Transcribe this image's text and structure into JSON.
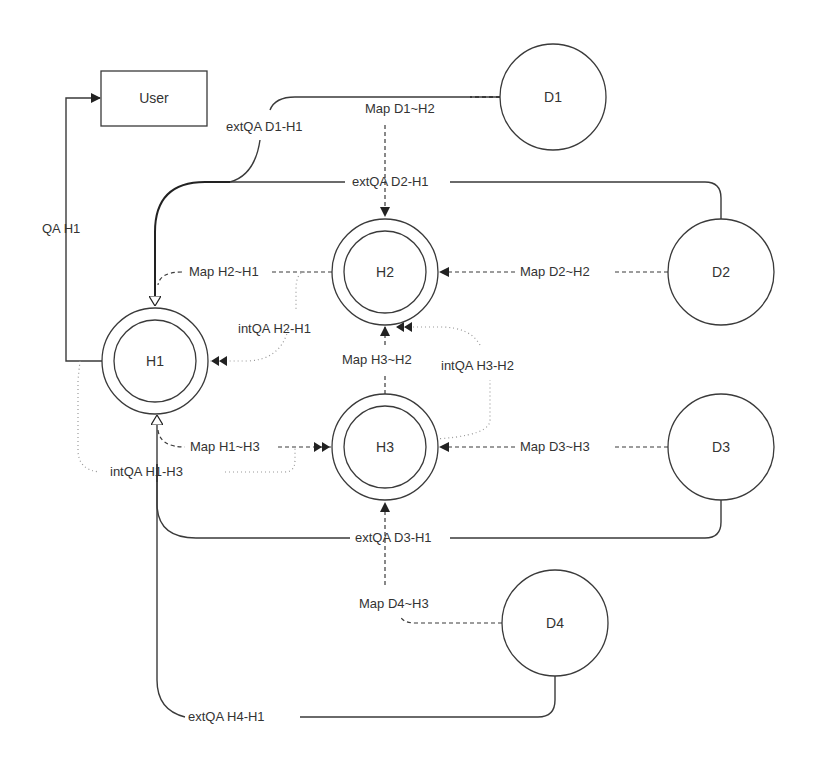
{
  "diagram": {
    "nodes": {
      "user": {
        "label": "User"
      },
      "h1": {
        "label": "H1"
      },
      "h2": {
        "label": "H2"
      },
      "h3": {
        "label": "H3"
      },
      "d1": {
        "label": "D1"
      },
      "d2": {
        "label": "D2"
      },
      "d3": {
        "label": "D3"
      },
      "d4": {
        "label": "D4"
      }
    },
    "edges": {
      "qa_h1": {
        "label": "QA H1"
      },
      "extqa_d1_h1": {
        "label": "extQA D1-H1"
      },
      "map_d1_h2": {
        "label": "Map D1~H2"
      },
      "extqa_d2_h1": {
        "label": "extQA D2-H1"
      },
      "map_h2_h1": {
        "label": "Map H2~H1"
      },
      "map_d2_h2": {
        "label": "Map D2~H2"
      },
      "intqa_h2_h1": {
        "label": "intQA H2-H1"
      },
      "map_h3_h2": {
        "label": "Map H3~H2"
      },
      "intqa_h3_h2": {
        "label": "intQA H3-H2"
      },
      "map_h1_h3": {
        "label": "Map H1~H3"
      },
      "map_d3_h3": {
        "label": "Map D3~H3"
      },
      "intqa_h1_h3": {
        "label": "intQA H1-H3"
      },
      "extqa_d3_h1": {
        "label": "extQA D3-H1"
      },
      "map_d4_h3": {
        "label": "Map D4~H3"
      },
      "extqa_h4_h1": {
        "label": "extQA H4-H1"
      }
    }
  }
}
